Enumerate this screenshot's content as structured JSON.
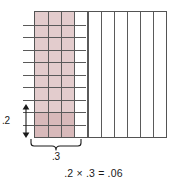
{
  "figure": {
    "type": "area-model-decimal-multiplication",
    "grid": {
      "columns": 10,
      "rows": 10,
      "column_rule_count": 9,
      "row_rule_count": 9,
      "border_color": "#545454",
      "rule_color": "#5a5a5a"
    },
    "shading": {
      "column_band": {
        "name": "factor-width-shading",
        "fraction": 0.3,
        "columns_shaded": 3,
        "color": "#e3cccd"
      },
      "overlap_block": {
        "name": "product-shading",
        "fraction_width": 0.3,
        "fraction_height": 0.2,
        "columns_shaded": 3,
        "rows_shaded": 2,
        "color": "#d8b9ba"
      }
    }
  },
  "labels": {
    "vertical_measure": ".2",
    "horizontal_measure": ".3",
    "equation": ".2 × .3 = .06"
  },
  "chart_data": {
    "type": "area-model",
    "title": "",
    "xlabel": ".3",
    "ylabel": ".2",
    "grid": true,
    "categories": [
      "width",
      "height",
      "product"
    ],
    "values": [
      0.3,
      0.2,
      0.06
    ],
    "annotations": [
      ".2 × .3 = .06"
    ],
    "grid_divisions_x": 10,
    "grid_divisions_y": 10,
    "shaded_columns": 3,
    "shaded_rows": 2,
    "shaded_cells_product": 6,
    "total_cells": 100
  }
}
